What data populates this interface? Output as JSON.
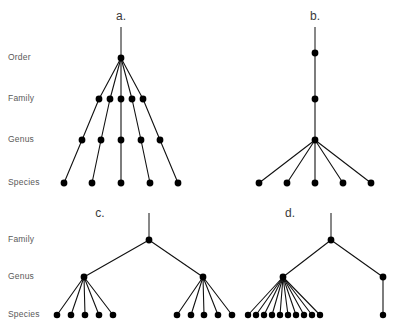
{
  "figure": {
    "background_color": "#ffffff",
    "node_color": "#000000",
    "edge_color": "#111111",
    "label_color": "#5a5a5a",
    "width": 401,
    "height": 330
  },
  "rank_labels_top": [
    {
      "text": "Order",
      "x": 8,
      "y": 58
    },
    {
      "text": "Family",
      "x": 8,
      "y": 99
    },
    {
      "text": "Genus",
      "x": 8,
      "y": 140
    },
    {
      "text": "Species",
      "x": 8,
      "y": 183
    }
  ],
  "rank_labels_bottom": [
    {
      "text": "Family",
      "x": 8,
      "y": 240
    },
    {
      "text": "Genus",
      "x": 8,
      "y": 277
    },
    {
      "text": "Species",
      "x": 8,
      "y": 315
    }
  ],
  "panels": [
    {
      "id": "panel-a",
      "letter": "a.",
      "letter_x": 121,
      "letter_y": 17,
      "description": "Order radiates into five families, each family to one genus, each genus to one species",
      "root_stem": {
        "x": 121,
        "y_top": 27,
        "y_bottom": 58
      },
      "levels": {
        "order": {
          "y": 58,
          "nodes": [
            {
              "x": 121
            }
          ]
        },
        "family": {
          "y": 99,
          "nodes": [
            {
              "x": 99
            },
            {
              "x": 110
            },
            {
              "x": 121
            },
            {
              "x": 132
            },
            {
              "x": 143
            }
          ]
        },
        "genus": {
          "y": 140,
          "nodes": [
            {
              "x": 82
            },
            {
              "x": 101
            },
            {
              "x": 121
            },
            {
              "x": 141
            },
            {
              "x": 160
            }
          ]
        },
        "species": {
          "y": 183,
          "nodes": [
            {
              "x": 64
            },
            {
              "x": 92
            },
            {
              "x": 121
            },
            {
              "x": 150
            },
            {
              "x": 178
            }
          ]
        }
      },
      "edges_order_to_family": [
        [
          0,
          0
        ],
        [
          0,
          1
        ],
        [
          0,
          2
        ],
        [
          0,
          3
        ],
        [
          0,
          4
        ]
      ],
      "edges_family_to_genus": [
        [
          0,
          0
        ],
        [
          1,
          1
        ],
        [
          2,
          2
        ],
        [
          3,
          3
        ],
        [
          4,
          4
        ]
      ],
      "edges_genus_to_species": [
        [
          0,
          0
        ],
        [
          1,
          1
        ],
        [
          2,
          2
        ],
        [
          3,
          3
        ],
        [
          4,
          4
        ]
      ]
    },
    {
      "id": "panel-b",
      "letter": "b.",
      "letter_x": 315,
      "letter_y": 17,
      "description": "A single unbranched lineage from order through family to genus, which then radiates into five species",
      "root_stem": {
        "x": 315,
        "y_top": 27,
        "y_bottom": 53
      },
      "levels": {
        "order": {
          "y": 53,
          "nodes": [
            {
              "x": 315
            }
          ]
        },
        "family": {
          "y": 99,
          "nodes": [
            {
              "x": 315
            }
          ]
        },
        "genus": {
          "y": 140,
          "nodes": [
            {
              "x": 315
            }
          ]
        },
        "species": {
          "y": 183,
          "nodes": [
            {
              "x": 259
            },
            {
              "x": 287
            },
            {
              "x": 315
            },
            {
              "x": 343
            },
            {
              "x": 371
            }
          ]
        }
      },
      "edges_order_to_family": [
        [
          0,
          0
        ]
      ],
      "edges_family_to_genus": [
        [
          0,
          0
        ]
      ],
      "edges_genus_to_species": [
        [
          0,
          0
        ],
        [
          0,
          1
        ],
        [
          0,
          2
        ],
        [
          0,
          3
        ],
        [
          0,
          4
        ]
      ]
    },
    {
      "id": "panel-c",
      "letter": "c.",
      "letter_x": 100,
      "letter_y": 214,
      "description": "Family splits into two genera of equal size, each genus containing five species",
      "root_stem": {
        "x": 149,
        "y_top": 213,
        "y_bottom": 240
      },
      "levels": {
        "family": {
          "y": 240,
          "nodes": [
            {
              "x": 149
            }
          ]
        },
        "genus": {
          "y": 277,
          "nodes": [
            {
              "x": 84
            },
            {
              "x": 203
            }
          ]
        },
        "species": {
          "y": 315,
          "nodes": [
            {
              "x": 57
            },
            {
              "x": 71
            },
            {
              "x": 85
            },
            {
              "x": 99
            },
            {
              "x": 113
            },
            {
              "x": 177
            },
            {
              "x": 191
            },
            {
              "x": 204
            },
            {
              "x": 218
            },
            {
              "x": 232
            }
          ]
        }
      },
      "edges_family_to_genus": [
        [
          0,
          0
        ],
        [
          0,
          1
        ]
      ],
      "edges_genus_to_species": [
        [
          0,
          0
        ],
        [
          0,
          1
        ],
        [
          0,
          2
        ],
        [
          0,
          3
        ],
        [
          0,
          4
        ],
        [
          1,
          5
        ],
        [
          1,
          6
        ],
        [
          1,
          7
        ],
        [
          1,
          8
        ],
        [
          1,
          9
        ]
      ]
    },
    {
      "id": "panel-d",
      "letter": "d.",
      "letter_x": 290,
      "letter_y": 214,
      "description": "Family splits into two unequal genera: a species-rich genus with ten species and a depauperate genus with one species",
      "root_stem": {
        "x": 331,
        "y_top": 213,
        "y_bottom": 240
      },
      "levels": {
        "family": {
          "y": 240,
          "nodes": [
            {
              "x": 331
            }
          ]
        },
        "genus": {
          "y": 277,
          "nodes": [
            {
              "x": 283
            },
            {
              "x": 383
            }
          ]
        },
        "species": {
          "y": 315,
          "nodes": [
            {
              "x": 248
            },
            {
              "x": 256
            },
            {
              "x": 264
            },
            {
              "x": 272
            },
            {
              "x": 280
            },
            {
              "x": 288
            },
            {
              "x": 296
            },
            {
              "x": 304
            },
            {
              "x": 312
            },
            {
              "x": 320
            },
            {
              "x": 383
            }
          ]
        }
      },
      "edges_family_to_genus": [
        [
          0,
          0
        ],
        [
          0,
          1
        ]
      ],
      "edges_genus_to_species": [
        [
          0,
          0
        ],
        [
          0,
          1
        ],
        [
          0,
          2
        ],
        [
          0,
          3
        ],
        [
          0,
          4
        ],
        [
          0,
          5
        ],
        [
          0,
          6
        ],
        [
          0,
          7
        ],
        [
          0,
          8
        ],
        [
          0,
          9
        ],
        [
          1,
          10
        ]
      ]
    }
  ]
}
